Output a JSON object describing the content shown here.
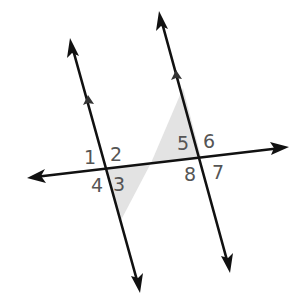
{
  "diagram": {
    "lines": [
      {
        "name": "parallel-line-left",
        "start": [
          140,
          292
        ],
        "end": [
          70,
          38
        ],
        "arrowheads": [
          "start",
          "end"
        ],
        "parallel_marker": true
      },
      {
        "name": "parallel-line-right",
        "start": [
          230,
          272
        ],
        "end": [
          159,
          11
        ],
        "arrowheads": [
          "start",
          "end"
        ],
        "parallel_marker": true
      },
      {
        "name": "transversal",
        "start": [
          27,
          178
        ],
        "end": [
          289,
          147
        ],
        "arrowheads": [
          "start",
          "end"
        ]
      }
    ],
    "intersections": {
      "left": [
        105,
        168
      ],
      "right": [
        201,
        157
      ]
    },
    "shaded_regions": [
      {
        "name": "shade-angle-3",
        "angle": "3"
      },
      {
        "name": "shade-angle-5",
        "angle": "5"
      }
    ],
    "angle_labels": [
      {
        "id": "1",
        "text": "1",
        "x": 84,
        "y": 164
      },
      {
        "id": "2",
        "text": "2",
        "x": 110,
        "y": 161
      },
      {
        "id": "3",
        "text": "3",
        "x": 113,
        "y": 191
      },
      {
        "id": "4",
        "text": "4",
        "x": 91,
        "y": 192
      },
      {
        "id": "5",
        "text": "5",
        "x": 177,
        "y": 150
      },
      {
        "id": "6",
        "text": "6",
        "x": 203,
        "y": 148
      },
      {
        "id": "7",
        "text": "7",
        "x": 212,
        "y": 179
      },
      {
        "id": "8",
        "text": "8",
        "x": 184,
        "y": 181
      }
    ],
    "colors": {
      "line": "#111111",
      "shade": "#e3e3e3",
      "label": "#555555",
      "background": "#ffffff"
    }
  }
}
